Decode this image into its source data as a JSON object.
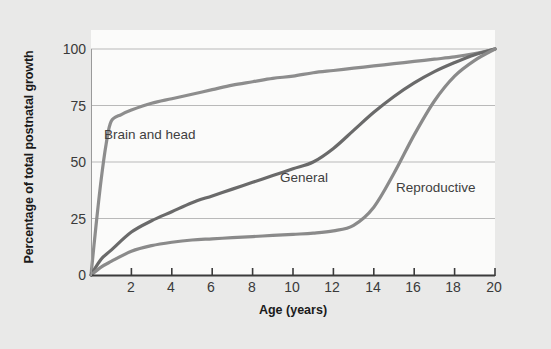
{
  "chart_data": {
    "type": "line",
    "title": "",
    "xlabel": "Age (years)",
    "ylabel": "Percentage of total postnatal growth",
    "xlim": [
      0,
      20
    ],
    "ylim": [
      0,
      100
    ],
    "xticks": [
      "0",
      "2",
      "4",
      "6",
      "8",
      "10",
      "12",
      "14",
      "16",
      "18",
      "20"
    ],
    "yticks": [
      "0",
      "25",
      "50",
      "75",
      "100"
    ],
    "grid": "horizontal",
    "legend": "inline-labels",
    "series": [
      {
        "name": "Brain and head",
        "label_text": "Brain and head",
        "color": "#8d8d8d",
        "x": [
          0,
          0.25,
          0.5,
          0.75,
          1,
          1.5,
          2,
          3,
          4,
          5,
          6,
          7,
          8,
          9,
          10,
          11,
          12,
          13,
          14,
          15,
          16,
          17,
          18,
          19,
          20
        ],
        "y": [
          0,
          22,
          42,
          58,
          68,
          71,
          73,
          76,
          78,
          80,
          82,
          84,
          85.5,
          87,
          88,
          89.5,
          90.5,
          91.5,
          92.5,
          93.5,
          94.5,
          95.5,
          96.5,
          98,
          100
        ]
      },
      {
        "name": "General",
        "label_text": "General",
        "color": "#6a6a6a",
        "x": [
          0,
          0.5,
          1,
          2,
          3,
          4,
          5,
          6,
          7,
          8,
          9,
          10,
          11,
          12,
          13,
          14,
          15,
          16,
          17,
          18,
          19,
          20
        ],
        "y": [
          0,
          7,
          11,
          19,
          24,
          28,
          32,
          35,
          38,
          41,
          44,
          47,
          50,
          56,
          64,
          72,
          79,
          85,
          90,
          94,
          97.5,
          100
        ]
      },
      {
        "name": "Reproductive",
        "label_text": "Reproductive",
        "color": "#8a8a8a",
        "x": [
          0,
          0.5,
          1,
          2,
          3,
          4,
          5,
          6,
          7,
          8,
          9,
          10,
          11,
          12,
          13,
          14,
          15,
          16,
          17,
          18,
          19,
          20
        ],
        "y": [
          0,
          3.5,
          6,
          10.5,
          13,
          14.5,
          15.5,
          16,
          16.5,
          17,
          17.5,
          18,
          18.5,
          19.5,
          22,
          30,
          45,
          62,
          77,
          88,
          95,
          100
        ]
      }
    ]
  },
  "credit": {
    "text": "© 2012 Cengage Learning"
  },
  "labels": {
    "brain": "Brain and head",
    "general": "General",
    "reproductive": "Reproductive"
  }
}
